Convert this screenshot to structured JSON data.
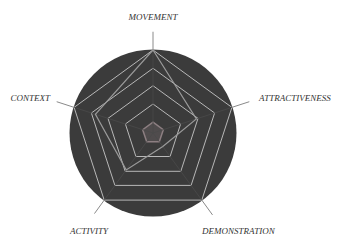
{
  "chart_data": {
    "type": "radar",
    "title": "",
    "axes": [
      "MOVEMENT",
      "ATTRACTIVENESS",
      "DEMONSTRATION",
      "ACTIVITY",
      "CONTEXT"
    ],
    "series": [
      {
        "name": "",
        "values": [
          1.0,
          0.55,
          0.2,
          0.55,
          0.73
        ],
        "color": "#9a9a9a"
      }
    ],
    "grid_rings": [
      1.0,
      0.78,
      0.57,
      0.35
    ],
    "inner_ring": 0.13,
    "range": [
      0,
      1
    ],
    "grid": true,
    "legend": "none"
  },
  "style": {
    "background_circle": "#3b3b3b",
    "grid_color": "#b8b8b8",
    "axis_line_color": "#8a8a8a",
    "series_color": "#9a9a9a",
    "inner_ring_color": "#8d7f82",
    "label_color": "#333333"
  },
  "geometry": {
    "cx": 153,
    "cy": 133,
    "radius": 83,
    "circle_radius": 83.5
  }
}
